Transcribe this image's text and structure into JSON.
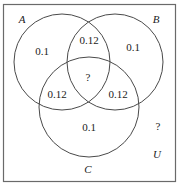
{
  "diagram": {
    "type": "venn-3-set",
    "universe_label": "U",
    "sets": [
      {
        "name": "A",
        "label": "A"
      },
      {
        "name": "B",
        "label": "B"
      },
      {
        "name": "C",
        "label": "C"
      }
    ],
    "regions": {
      "a_only": "0.1",
      "b_only": "0.1",
      "c_only": "0.1",
      "a_and_b_only": "0.12",
      "a_and_c_only": "0.12",
      "b_and_c_only": "0.12",
      "a_and_b_and_c": "?",
      "outside": "?"
    },
    "colors": {
      "stroke": "#4a4a4a",
      "frame": "#6a6a6a",
      "text": "#222222",
      "background": "#ffffff"
    }
  }
}
